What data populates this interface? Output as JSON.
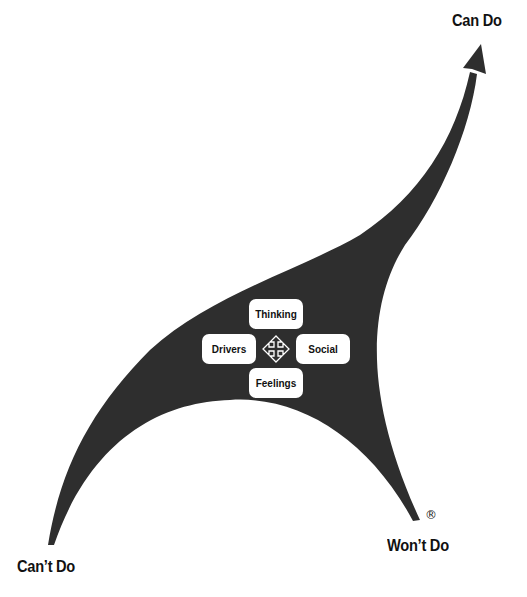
{
  "diagram": {
    "labels": {
      "top_right": "Can Do",
      "bottom_left": "Can’t Do",
      "bottom_right": "Won’t Do",
      "registered_mark": "®"
    },
    "center_boxes": {
      "top": "Thinking",
      "left": "Drivers",
      "right": "Social",
      "bottom": "Feelings"
    },
    "center_icon": "four-way-arrow-icon",
    "colors": {
      "shape_fill": "#2e2e2e",
      "box_fill": "#ffffff",
      "text": "#111111",
      "background": "#ffffff"
    }
  }
}
